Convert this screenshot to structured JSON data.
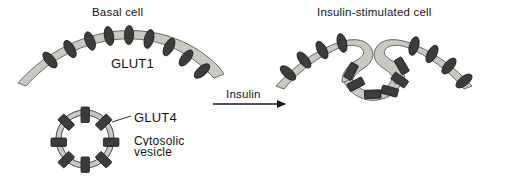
{
  "figure": {
    "kind": "biological-diagram",
    "background_color": "#ffffff",
    "membrane_fill": "#c9c9c1",
    "membrane_stroke": "#5a5a55",
    "transporter_fill": "#3c3c3c",
    "transporter_stroke": "#1b1b1b",
    "text_color": "#141414"
  },
  "panels": {
    "left": {
      "title": "Basal cell",
      "membrane_label": "GLUT1",
      "transporter_count": 9
    },
    "right": {
      "title": "Insulin-stimulated cell",
      "transporter_count": 14
    }
  },
  "vesicle": {
    "label": "GLUT4",
    "caption_line1": "Cytosolic",
    "caption_line2": "vesicle",
    "transporter_count": 8
  },
  "arrow": {
    "label": "Insulin",
    "direction": "right"
  }
}
